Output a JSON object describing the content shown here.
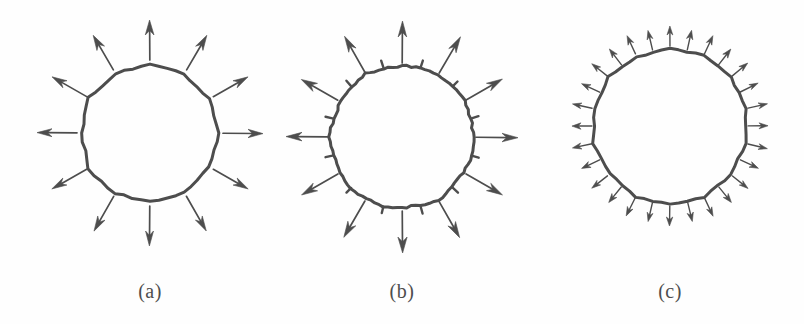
{
  "figure": {
    "background_color": "#fefefe",
    "ink_color": "#4d4d4d",
    "width": 804,
    "height": 324,
    "label_font_size": 20,
    "label_y": 280
  },
  "panels": [
    {
      "id": "a",
      "label": "(a)",
      "label_x": 150,
      "description": "Coarse sampling: twelve long outward normal arrows",
      "center_x": 150,
      "center_y": 133,
      "radius": 70,
      "polygon_sides": 12,
      "polygon_rotation_deg": -90,
      "jitter": 2.4,
      "stroke_width": 3.0,
      "arrows": {
        "count": 12,
        "kind": "long",
        "start_offset": 3,
        "shaft_length": 40,
        "head_length": 15,
        "head_half_width": 4.2,
        "shaft_width": 1.7,
        "angle_offset_deg": -90,
        "angles_deg": [
          -90,
          -60,
          -30,
          0,
          30,
          60,
          90,
          120,
          150,
          180,
          210,
          240
        ]
      },
      "ticks": {
        "count": 0,
        "kind": "none",
        "length": 0,
        "angles_deg": []
      }
    },
    {
      "id": "b",
      "label": "(b)",
      "label_x": 402,
      "description": "Medium sampling: twelve long normal arrows interleaved with twelve short tick stubs",
      "center_x": 402,
      "center_y": 137,
      "radius": 72,
      "polygon_sides": 24,
      "polygon_rotation_deg": -90,
      "jitter": 1.9,
      "stroke_width": 3.0,
      "arrows": {
        "count": 12,
        "kind": "long",
        "start_offset": 2,
        "shaft_length": 42,
        "head_length": 16,
        "head_half_width": 4.4,
        "shaft_width": 1.7,
        "angle_offset_deg": -90,
        "angles_deg": [
          -90,
          -60,
          -30,
          0,
          30,
          60,
          90,
          120,
          150,
          180,
          210,
          240
        ]
      },
      "ticks": {
        "count": 12,
        "kind": "stub",
        "length": 7,
        "width": 2.4,
        "angle_offset_deg": -75,
        "angles_deg": [
          -75,
          -45,
          -15,
          15,
          45,
          75,
          105,
          135,
          165,
          195,
          225,
          255
        ]
      }
    },
    {
      "id": "c",
      "label": "(c)",
      "label_x": 670,
      "description": "Dense sampling: twenty-eight short outward normal arrows",
      "center_x": 670,
      "center_y": 126,
      "radius": 78,
      "polygon_sides": 14,
      "polygon_rotation_deg": -90,
      "jitter": 1.6,
      "stroke_width": 3.0,
      "arrows": {
        "count": 28,
        "kind": "short",
        "start_offset": 2,
        "shaft_length": 20,
        "head_length": 9,
        "head_half_width": 3.0,
        "shaft_width": 1.4,
        "angle_offset_deg": -90,
        "angles_deg": [
          -90,
          -77.1,
          -64.3,
          -51.4,
          -38.6,
          -25.7,
          -12.9,
          0,
          12.9,
          25.7,
          38.6,
          51.4,
          64.3,
          77.1,
          90,
          102.9,
          115.7,
          128.6,
          141.4,
          154.3,
          167.1,
          180,
          192.9,
          205.7,
          218.6,
          231.4,
          244.3,
          257.1
        ]
      },
      "ticks": {
        "count": 0,
        "kind": "none",
        "length": 0,
        "angles_deg": []
      }
    }
  ]
}
